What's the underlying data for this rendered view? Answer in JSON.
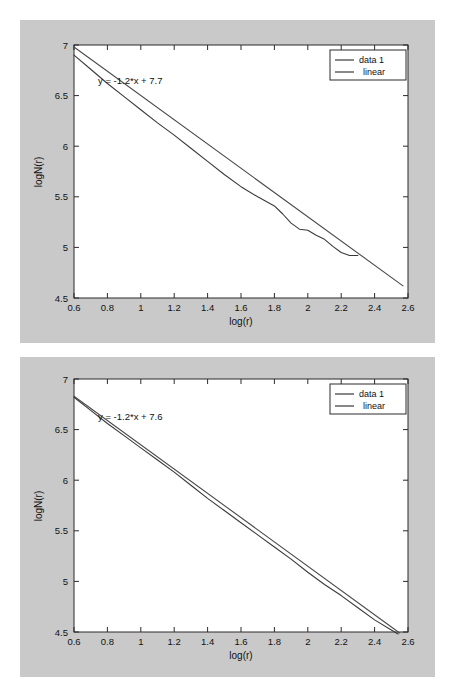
{
  "page": {
    "background_color": "#ffffff",
    "figure_background_color": "#c9c9c9",
    "axes_background_color": "#ffffff",
    "line_color": "#3a3a3a"
  },
  "chart_data": [
    {
      "id": "top",
      "type": "line",
      "title": "",
      "xlabel": "log(r)",
      "ylabel": "logN(r)",
      "xlim": [
        0.6,
        2.6
      ],
      "ylim": [
        4.5,
        7.0
      ],
      "xticks": [
        "0.6",
        "0.8",
        "1",
        "1.2",
        "1.4",
        "1.6",
        "1.8",
        "2",
        "2.2",
        "2.4",
        "2.6"
      ],
      "xtick_values": [
        0.6,
        0.8,
        1.0,
        1.2,
        1.4,
        1.6,
        1.8,
        2.0,
        2.2,
        2.4,
        2.6
      ],
      "yticks": [
        "7",
        "6.5",
        "6",
        "5.5",
        "5",
        "4.5"
      ],
      "ytick_values": [
        7.0,
        6.5,
        6.0,
        5.5,
        5.0,
        4.5
      ],
      "grid": false,
      "legend_position": "top-right",
      "legend": [
        "data 1",
        "linear"
      ],
      "annotation": "y = -1.2*x + 7.7",
      "fit": {
        "slope": -1.2,
        "intercept": 7.7
      },
      "series": [
        {
          "name": "data 1",
          "x": [
            0.6,
            0.7,
            0.8,
            0.9,
            1.0,
            1.1,
            1.2,
            1.3,
            1.4,
            1.5,
            1.6,
            1.7,
            1.8,
            1.85,
            1.9,
            1.95,
            2.0,
            2.05,
            2.1,
            2.15,
            2.2,
            2.25,
            2.3
          ],
          "y": [
            6.9,
            6.76,
            6.62,
            6.49,
            6.36,
            6.23,
            6.11,
            5.98,
            5.85,
            5.72,
            5.6,
            5.5,
            5.41,
            5.33,
            5.24,
            5.18,
            5.17,
            5.12,
            5.08,
            5.01,
            4.95,
            4.92,
            4.92
          ]
        },
        {
          "name": "linear",
          "x": [
            0.6,
            2.57
          ],
          "y": [
            6.98,
            4.62
          ]
        }
      ]
    },
    {
      "id": "bottom",
      "type": "line",
      "title": "",
      "xlabel": "log(r)",
      "ylabel": "logN(r)",
      "xlim": [
        0.6,
        2.6
      ],
      "ylim": [
        4.5,
        7.0
      ],
      "xticks": [
        "0.6",
        "0.8",
        "1",
        "1.2",
        "1.4",
        "1.6",
        "1.8",
        "2",
        "2.2",
        "2.4",
        "2.6"
      ],
      "xtick_values": [
        0.6,
        0.8,
        1.0,
        1.2,
        1.4,
        1.6,
        1.8,
        2.0,
        2.2,
        2.4,
        2.6
      ],
      "yticks": [
        "7",
        "6.5",
        "6",
        "5.5",
        "5",
        "4.5"
      ],
      "ytick_values": [
        7.0,
        6.5,
        6.0,
        5.5,
        5.0,
        4.5
      ],
      "grid": false,
      "legend_position": "top-right",
      "legend": [
        "data 1",
        "linear"
      ],
      "annotation": "y = -1.2*x + 7.6",
      "fit": {
        "slope": -1.2,
        "intercept": 7.6
      },
      "series": [
        {
          "name": "data 1",
          "x": [
            0.6,
            0.7,
            0.8,
            0.9,
            1.0,
            1.1,
            1.2,
            1.3,
            1.4,
            1.5,
            1.6,
            1.7,
            1.8,
            1.9,
            2.0,
            2.1,
            2.2,
            2.3,
            2.4,
            2.5,
            2.54
          ],
          "y": [
            6.82,
            6.69,
            6.56,
            6.44,
            6.32,
            6.2,
            6.08,
            5.95,
            5.82,
            5.7,
            5.58,
            5.46,
            5.34,
            5.22,
            5.09,
            4.97,
            4.86,
            4.74,
            4.62,
            4.52,
            4.48
          ]
        },
        {
          "name": "linear",
          "x": [
            0.6,
            2.55
          ],
          "y": [
            6.83,
            4.49
          ]
        }
      ]
    }
  ]
}
